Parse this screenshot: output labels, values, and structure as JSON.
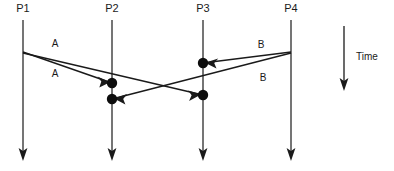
{
  "diagram": {
    "colors": {
      "line": "#1a1a1a",
      "lifeline": "#2b2b2b",
      "dot": "#0d0d0d",
      "background": "#ffffff",
      "text": "#1a1a1a"
    },
    "processes": [
      {
        "id": "p1",
        "label": "P1",
        "x": 23,
        "label_y": 12,
        "line_top": 20,
        "line_bottom": 160
      },
      {
        "id": "p2",
        "label": "P2",
        "x": 112,
        "label_y": 12,
        "line_top": 20,
        "line_bottom": 160
      },
      {
        "id": "p3",
        "label": "P3",
        "x": 203,
        "label_y": 12,
        "line_top": 20,
        "line_bottom": 160
      },
      {
        "id": "p4",
        "label": "P4",
        "x": 291,
        "label_y": 12,
        "line_top": 20,
        "line_bottom": 160
      }
    ],
    "events": [
      {
        "id": "e-p1-send",
        "process": "p1",
        "x": 23,
        "y": 52,
        "dot": false
      },
      {
        "id": "e-p2-recv1",
        "process": "p2",
        "x": 112,
        "y": 83,
        "dot": true
      },
      {
        "id": "e-p2-recv2",
        "process": "p2",
        "x": 112,
        "y": 99,
        "dot": true
      },
      {
        "id": "e-p3-recv1",
        "process": "p3",
        "x": 203,
        "y": 63,
        "dot": true
      },
      {
        "id": "e-p3-recv2",
        "process": "p3",
        "x": 203,
        "y": 95,
        "dot": true
      },
      {
        "id": "e-p4-send",
        "process": "p4",
        "x": 291,
        "y": 52,
        "dot": false
      }
    ],
    "messages": [
      {
        "id": "msg-a1",
        "label": "A",
        "from": "p1",
        "to": "p2",
        "x1": 23,
        "y1": 52,
        "x2": 112,
        "y2": 83,
        "label_x": 55,
        "label_y": 47
      },
      {
        "id": "msg-a2",
        "label": "A",
        "from": "p1",
        "to": "p3",
        "x1": 23,
        "y1": 53,
        "x2": 203,
        "y2": 95,
        "label_x": 55,
        "label_y": 77
      },
      {
        "id": "msg-b1",
        "label": "B",
        "from": "p4",
        "to": "p3",
        "x1": 291,
        "y1": 52,
        "x2": 203,
        "y2": 63,
        "label_x": 261,
        "label_y": 48
      },
      {
        "id": "msg-b2",
        "label": "B",
        "from": "p4",
        "to": "p2",
        "x1": 291,
        "y1": 53,
        "x2": 112,
        "y2": 99,
        "label_x": 263,
        "label_y": 81
      }
    ],
    "time_axis": {
      "label": "Time",
      "x": 344,
      "y_top": 26,
      "y_bottom": 90,
      "label_x": 356,
      "label_y": 60
    }
  }
}
